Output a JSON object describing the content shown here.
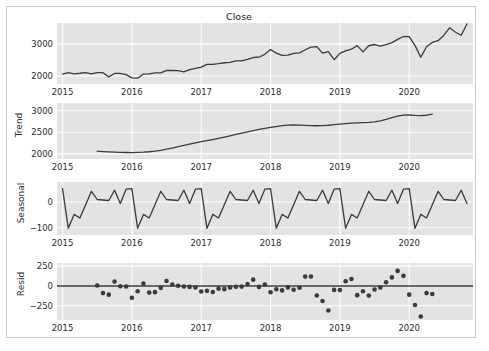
{
  "figure": {
    "title": "Close",
    "background": "#ffffff",
    "frame_color": "#c8c8c8",
    "panel_background": "#e3e3e3",
    "grid_color": "#ffffff",
    "line_color": "#3b3b3b",
    "marker_color": "#3b3b3b"
  },
  "chart_data": [
    {
      "type": "line",
      "title": "Close",
      "name": "Close",
      "ylabel": "",
      "xlabel": "",
      "grid": true,
      "xlim": [
        2014.92,
        2020.92
      ],
      "ylim": [
        1750,
        3650
      ],
      "yticks": [
        2000,
        3000
      ],
      "xticks": [
        2015,
        2016,
        2017,
        2018,
        2019,
        2020
      ],
      "x": [
        2015.0,
        2015.083,
        2015.167,
        2015.25,
        2015.333,
        2015.417,
        2015.5,
        2015.583,
        2015.667,
        2015.75,
        2015.833,
        2015.917,
        2016.0,
        2016.083,
        2016.167,
        2016.25,
        2016.333,
        2016.417,
        2016.5,
        2016.583,
        2016.667,
        2016.75,
        2016.833,
        2016.917,
        2017.0,
        2017.083,
        2017.167,
        2017.25,
        2017.333,
        2017.417,
        2017.5,
        2017.583,
        2017.667,
        2017.75,
        2017.833,
        2017.917,
        2018.0,
        2018.083,
        2018.167,
        2018.25,
        2018.333,
        2018.417,
        2018.5,
        2018.583,
        2018.667,
        2018.75,
        2018.833,
        2018.917,
        2019.0,
        2019.083,
        2019.167,
        2019.25,
        2019.333,
        2019.417,
        2019.5,
        2019.583,
        2019.667,
        2019.75,
        2019.833,
        2019.917,
        2020.0,
        2020.083,
        2020.167,
        2020.25,
        2020.333,
        2020.417,
        2020.5,
        2020.583,
        2020.667,
        2020.75,
        2020.833
      ],
      "values": [
        2058,
        2105,
        2068,
        2085,
        2107,
        2063,
        2104,
        2103,
        1972,
        2079,
        2080,
        2043,
        1940,
        1932,
        2059,
        2065,
        2096,
        2099,
        2174,
        2171,
        2168,
        2126,
        2199,
        2239,
        2278,
        2363,
        2362,
        2384,
        2412,
        2423,
        2470,
        2471,
        2519,
        2575,
        2584,
        2673,
        2823,
        2713,
        2641,
        2648,
        2705,
        2718,
        2816,
        2901,
        2914,
        2711,
        2760,
        2506,
        2704,
        2784,
        2834,
        2945,
        2752,
        2941,
        2980,
        2926,
        2976,
        3037,
        3140,
        3230,
        3225,
        2954,
        2584,
        2912,
        3044,
        3100,
        3271,
        3500,
        3363,
        3269,
        3621
      ]
    },
    {
      "type": "line",
      "title": "",
      "name": "Trend",
      "ylabel": "Trend",
      "xlabel": "",
      "grid": true,
      "xlim": [
        2014.92,
        2020.92
      ],
      "ylim": [
        1880,
        3180
      ],
      "yticks": [
        2000,
        2500,
        3000
      ],
      "xticks": [
        2015,
        2016,
        2017,
        2018,
        2019,
        2020
      ],
      "x": [
        2015.5,
        2015.583,
        2015.667,
        2015.75,
        2015.833,
        2015.917,
        2016.0,
        2016.083,
        2016.167,
        2016.25,
        2016.333,
        2016.417,
        2016.5,
        2016.583,
        2016.667,
        2016.75,
        2016.833,
        2016.917,
        2017.0,
        2017.083,
        2017.167,
        2017.25,
        2017.333,
        2017.417,
        2017.5,
        2017.583,
        2017.667,
        2017.75,
        2017.833,
        2017.917,
        2018.0,
        2018.083,
        2018.167,
        2018.25,
        2018.333,
        2018.417,
        2018.5,
        2018.583,
        2018.667,
        2018.75,
        2018.833,
        2018.917,
        2019.0,
        2019.083,
        2019.167,
        2019.25,
        2019.333,
        2019.417,
        2019.5,
        2019.583,
        2019.667,
        2019.75,
        2019.833,
        2019.917,
        2020.0,
        2020.083,
        2020.167,
        2020.25,
        2020.333
      ],
      "values": [
        2062,
        2052,
        2044,
        2038,
        2034,
        2031,
        2030,
        2033,
        2038,
        2048,
        2062,
        2082,
        2107,
        2135,
        2166,
        2198,
        2228,
        2256,
        2281,
        2305,
        2330,
        2357,
        2387,
        2418,
        2450,
        2482,
        2512,
        2541,
        2567,
        2590,
        2612,
        2634,
        2654,
        2668,
        2671,
        2666,
        2659,
        2653,
        2652,
        2656,
        2664,
        2676,
        2690,
        2702,
        2712,
        2720,
        2726,
        2730,
        2740,
        2765,
        2800,
        2840,
        2875,
        2898,
        2902,
        2893,
        2888,
        2896,
        2920,
        2955,
        3000,
        3050,
        3090
      ]
    },
    {
      "type": "line",
      "title": "",
      "name": "Seasonal",
      "ylabel": "Seasonal",
      "xlabel": "",
      "grid": true,
      "xlim": [
        2014.92,
        2020.92
      ],
      "ylim": [
        -128,
        78
      ],
      "yticks": [
        0,
        -100
      ],
      "xticks": [
        2015,
        2016,
        2017,
        2018,
        2019,
        2020
      ],
      "period": 12,
      "pattern_months": [
        "Jan",
        "Feb",
        "Mar",
        "Apr",
        "May",
        "Jun",
        "Jul",
        "Aug",
        "Sep",
        "Oct",
        "Nov",
        "Dec"
      ],
      "pattern_values": [
        52,
        -102,
        -48,
        -62,
        -10,
        42,
        10,
        8,
        6,
        46,
        -6,
        50
      ],
      "x": [
        2015.0,
        2015.083,
        2015.167,
        2015.25,
        2015.333,
        2015.417,
        2015.5,
        2015.583,
        2015.667,
        2015.75,
        2015.833,
        2015.917,
        2016.0,
        2016.083,
        2016.167,
        2016.25,
        2016.333,
        2016.417,
        2016.5,
        2016.583,
        2016.667,
        2016.75,
        2016.833,
        2016.917,
        2017.0,
        2017.083,
        2017.167,
        2017.25,
        2017.333,
        2017.417,
        2017.5,
        2017.583,
        2017.667,
        2017.75,
        2017.833,
        2017.917,
        2018.0,
        2018.083,
        2018.167,
        2018.25,
        2018.333,
        2018.417,
        2018.5,
        2018.583,
        2018.667,
        2018.75,
        2018.833,
        2018.917,
        2019.0,
        2019.083,
        2019.167,
        2019.25,
        2019.333,
        2019.417,
        2019.5,
        2019.583,
        2019.667,
        2019.75,
        2019.833,
        2019.917,
        2020.0,
        2020.083,
        2020.167,
        2020.25,
        2020.333,
        2020.417,
        2020.5,
        2020.583,
        2020.667,
        2020.75,
        2020.833
      ],
      "values": [
        52,
        -102,
        -48,
        -62,
        -10,
        42,
        10,
        8,
        6,
        46,
        -6,
        50,
        52,
        -102,
        -48,
        -62,
        -10,
        42,
        10,
        8,
        6,
        46,
        -6,
        50,
        52,
        -102,
        -48,
        -62,
        -10,
        42,
        10,
        8,
        6,
        46,
        -6,
        50,
        52,
        -102,
        -48,
        -62,
        -10,
        42,
        10,
        8,
        6,
        46,
        -6,
        50,
        52,
        -102,
        -48,
        -62,
        -10,
        42,
        10,
        8,
        6,
        46,
        -6,
        50,
        52,
        -102,
        -48,
        -62,
        -10,
        42,
        10,
        8,
        6,
        46,
        -6
      ]
    },
    {
      "type": "scatter",
      "title": "",
      "name": "Resid",
      "ylabel": "Resid",
      "xlabel": "",
      "grid": true,
      "xlim": [
        2014.92,
        2020.92
      ],
      "ylim": [
        -430,
        290
      ],
      "yticks": [
        250,
        0,
        -250
      ],
      "xticks": [
        2015,
        2016,
        2017,
        2018,
        2019,
        2020
      ],
      "zero_line": 0,
      "x": [
        2015.5,
        2015.583,
        2015.667,
        2015.75,
        2015.833,
        2015.917,
        2016.0,
        2016.083,
        2016.167,
        2016.25,
        2016.333,
        2016.417,
        2016.5,
        2016.583,
        2016.667,
        2016.75,
        2016.833,
        2016.917,
        2017.0,
        2017.083,
        2017.167,
        2017.25,
        2017.333,
        2017.417,
        2017.5,
        2017.583,
        2017.667,
        2017.75,
        2017.833,
        2017.917,
        2018.0,
        2018.083,
        2018.167,
        2018.25,
        2018.333,
        2018.417,
        2018.5,
        2018.583,
        2018.667,
        2018.75,
        2018.833,
        2018.917,
        2019.0,
        2019.083,
        2019.167,
        2019.25,
        2019.333,
        2019.417,
        2019.5,
        2019.583,
        2019.667,
        2019.75,
        2019.833,
        2019.917,
        2020.0,
        2020.083,
        2020.167,
        2020.25,
        2020.333
      ],
      "values": [
        5,
        -90,
        -110,
        55,
        -4,
        -6,
        -148,
        -66,
        30,
        -84,
        -78,
        -24,
        62,
        18,
        2,
        -6,
        -12,
        -20,
        -70,
        -62,
        -76,
        -34,
        -40,
        -18,
        -10,
        -8,
        24,
        80,
        -12,
        18,
        -80,
        -42,
        -56,
        -18,
        -48,
        -22,
        118,
        120,
        -120,
        -190,
        -310,
        -50,
        -52,
        60,
        88,
        -116,
        -66,
        -122,
        -44,
        -18,
        46,
        108,
        190,
        128,
        -110,
        -240,
        -386,
        -90,
        -102
      ]
    }
  ],
  "axes": [
    {
      "name": "Close",
      "ylabel": "",
      "yticks": [
        "3000",
        "2000"
      ],
      "xticks": [
        "2015",
        "2016",
        "2017",
        "2018",
        "2019",
        "2020"
      ]
    },
    {
      "name": "Trend",
      "ylabel": "Trend",
      "yticks": [
        "3000",
        "2500",
        "2000"
      ],
      "xticks": [
        "2015",
        "2016",
        "2017",
        "2018",
        "2019",
        "2020"
      ]
    },
    {
      "name": "Seasonal",
      "ylabel": "Seasonal",
      "yticks": [
        "0",
        "−100"
      ],
      "xticks": [
        "2015",
        "2016",
        "2017",
        "2018",
        "2019",
        "2020"
      ]
    },
    {
      "name": "Resid",
      "ylabel": "Resid",
      "yticks": [
        "250",
        "0",
        "−250"
      ],
      "xticks": [
        "2015",
        "2016",
        "2017",
        "2018",
        "2019",
        "2020"
      ]
    }
  ]
}
